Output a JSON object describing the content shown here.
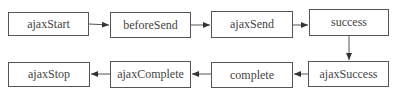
{
  "diagram": {
    "type": "flowchart",
    "colors": {
      "stroke": "#555555",
      "text": "#444444",
      "background": "#ffffff"
    },
    "nodes": [
      {
        "id": "ajaxStart",
        "label": "ajaxStart",
        "x": 8,
        "y": 12,
        "w": 81,
        "h": 24
      },
      {
        "id": "beforeSend",
        "label": "beforeSend",
        "x": 110,
        "y": 12,
        "w": 81,
        "h": 26
      },
      {
        "id": "ajaxSend",
        "label": "ajaxSend",
        "x": 211,
        "y": 11,
        "w": 82,
        "h": 27
      },
      {
        "id": "success",
        "label": "success",
        "x": 309,
        "y": 9,
        "w": 80,
        "h": 27
      },
      {
        "id": "ajaxSuccess",
        "label": "ajaxSuccess",
        "x": 308,
        "y": 61,
        "w": 81,
        "h": 26
      },
      {
        "id": "complete",
        "label": "complete",
        "x": 211,
        "y": 62,
        "w": 82,
        "h": 26
      },
      {
        "id": "ajaxComplete",
        "label": "ajaxComplete",
        "x": 110,
        "y": 61,
        "w": 81,
        "h": 27
      },
      {
        "id": "ajaxStop",
        "label": "ajaxStop",
        "x": 8,
        "y": 62,
        "w": 82,
        "h": 25
      }
    ],
    "edges": [
      {
        "from": "ajaxStart",
        "to": "beforeSend"
      },
      {
        "from": "beforeSend",
        "to": "ajaxSend"
      },
      {
        "from": "ajaxSend",
        "to": "success"
      },
      {
        "from": "success",
        "to": "ajaxSuccess"
      },
      {
        "from": "ajaxSuccess",
        "to": "complete"
      },
      {
        "from": "complete",
        "to": "ajaxComplete"
      },
      {
        "from": "ajaxComplete",
        "to": "ajaxStop"
      }
    ]
  }
}
